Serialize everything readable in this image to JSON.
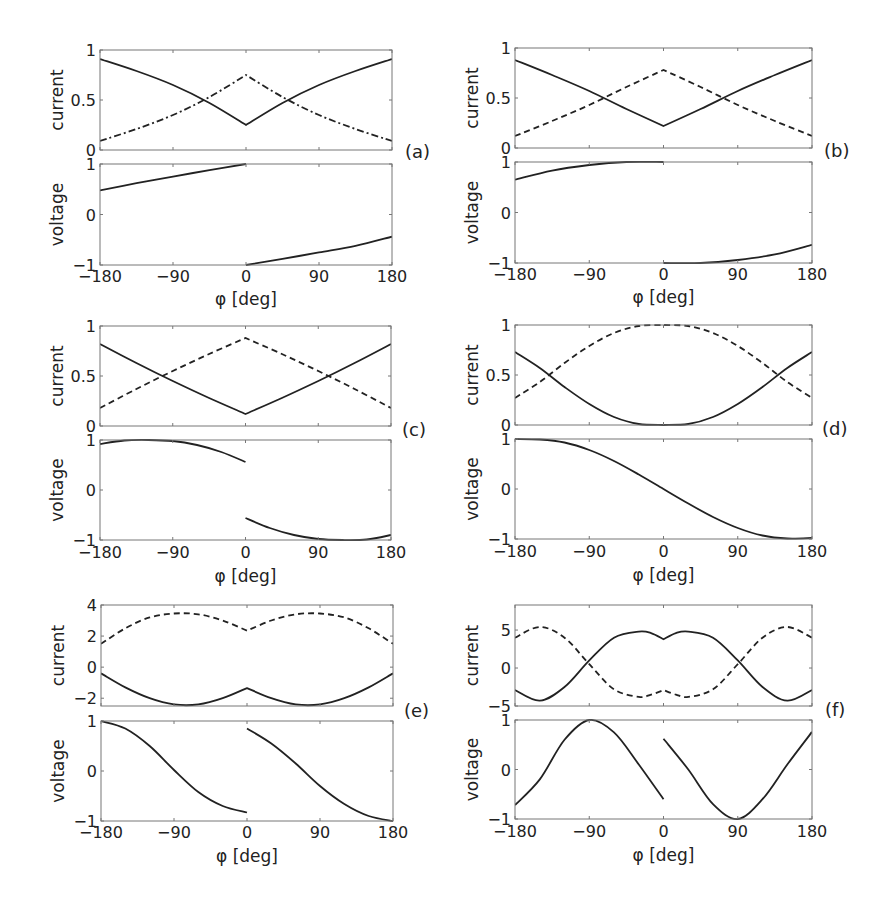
{
  "figure": {
    "x_tick_labels": [
      "−180",
      "−90",
      "0",
      "90",
      "180"
    ],
    "x_ticks": [
      -180,
      -90,
      0,
      90,
      180
    ],
    "xlabel": "φ [deg]",
    "current_label": "current",
    "voltage_label": "voltage"
  },
  "chart_data": [
    {
      "panel": "(a)",
      "type": "line",
      "xlabel": "φ [deg]",
      "xlim": [
        -180,
        180
      ],
      "subplots": [
        {
          "ylabel": "current",
          "ylim": [
            0,
            1
          ],
          "yticks": [
            0,
            0.5,
            1
          ],
          "ytick_labels": [
            "0",
            "0.5",
            "1"
          ],
          "series": [
            {
              "name": "solid",
              "style": "solid",
              "x": [
                -180,
                -135,
                -90,
                -45,
                0,
                45,
                90,
                135,
                180
              ],
              "y": [
                0.91,
                0.79,
                0.65,
                0.47,
                0.25,
                0.47,
                0.65,
                0.79,
                0.91
              ]
            },
            {
              "name": "dash-dot",
              "style": "dashdot",
              "x": [
                -180,
                -135,
                -90,
                -45,
                0,
                45,
                90,
                135,
                180
              ],
              "y": [
                0.09,
                0.21,
                0.35,
                0.53,
                0.75,
                0.53,
                0.35,
                0.21,
                0.09
              ]
            }
          ]
        },
        {
          "ylabel": "voltage",
          "ylim": [
            -1,
            1
          ],
          "yticks": [
            -1,
            0,
            1
          ],
          "ytick_labels": [
            "−1",
            "0",
            "1"
          ],
          "series": [
            {
              "name": "solid-left",
              "style": "solid",
              "x": [
                -180,
                -135,
                -90,
                -45,
                0
              ],
              "y": [
                0.48,
                0.62,
                0.75,
                0.88,
                1.0
              ]
            },
            {
              "name": "solid-right",
              "style": "solid",
              "x": [
                0,
                45,
                90,
                135,
                180
              ],
              "y": [
                -1.0,
                -0.88,
                -0.75,
                -0.62,
                -0.44
              ]
            }
          ]
        }
      ]
    },
    {
      "panel": "(b)",
      "type": "line",
      "xlabel": "φ [deg]",
      "xlim": [
        -180,
        180
      ],
      "subplots": [
        {
          "ylabel": "current",
          "ylim": [
            0,
            1
          ],
          "yticks": [
            0,
            0.5,
            1
          ],
          "ytick_labels": [
            "0",
            "0.5",
            "1"
          ],
          "series": [
            {
              "name": "solid",
              "style": "solid",
              "x": [
                -180,
                -135,
                -90,
                -45,
                0,
                45,
                90,
                135,
                180
              ],
              "y": [
                0.88,
                0.73,
                0.57,
                0.39,
                0.22,
                0.39,
                0.57,
                0.73,
                0.88
              ]
            },
            {
              "name": "dashed",
              "style": "dashed",
              "x": [
                -180,
                -135,
                -90,
                -45,
                0,
                45,
                90,
                135,
                180
              ],
              "y": [
                0.12,
                0.27,
                0.43,
                0.61,
                0.78,
                0.61,
                0.43,
                0.27,
                0.12
              ]
            }
          ]
        },
        {
          "ylabel": "voltage",
          "ylim": [
            -1,
            1
          ],
          "yticks": [
            -1,
            0,
            1
          ],
          "ytick_labels": [
            "−1",
            "0",
            "1"
          ],
          "series": [
            {
              "name": "solid-left",
              "style": "solid",
              "x": [
                -180,
                -135,
                -90,
                -45,
                0
              ],
              "y": [
                0.65,
                0.83,
                0.94,
                1.0,
                1.0
              ]
            },
            {
              "name": "solid-right",
              "style": "solid",
              "x": [
                0,
                45,
                90,
                135,
                180
              ],
              "y": [
                -1.0,
                -1.0,
                -0.94,
                -0.83,
                -0.64
              ]
            }
          ]
        }
      ]
    },
    {
      "panel": "(c)",
      "type": "line",
      "xlabel": "φ [deg]",
      "xlim": [
        -180,
        180
      ],
      "subplots": [
        {
          "ylabel": "current",
          "ylim": [
            0,
            1
          ],
          "yticks": [
            0,
            0.5,
            1
          ],
          "ytick_labels": [
            "0",
            "0.5",
            "1"
          ],
          "series": [
            {
              "name": "solid",
              "style": "solid",
              "x": [
                -180,
                -135,
                -90,
                -45,
                0,
                45,
                90,
                135,
                180
              ],
              "y": [
                0.82,
                0.63,
                0.45,
                0.28,
                0.12,
                0.28,
                0.45,
                0.63,
                0.82
              ]
            },
            {
              "name": "dashed",
              "style": "dashed",
              "x": [
                -180,
                -135,
                -90,
                -45,
                0,
                45,
                90,
                135,
                180
              ],
              "y": [
                0.18,
                0.37,
                0.55,
                0.72,
                0.88,
                0.72,
                0.55,
                0.37,
                0.18
              ]
            }
          ]
        },
        {
          "ylabel": "voltage",
          "ylim": [
            -1,
            1
          ],
          "yticks": [
            -1,
            0,
            1
          ],
          "ytick_labels": [
            "−1",
            "0",
            "1"
          ],
          "series": [
            {
              "name": "solid-left",
              "style": "solid",
              "x": [
                -180,
                -150,
                -120,
                -90,
                -60,
                -30,
                0
              ],
              "y": [
                0.92,
                0.99,
                1.0,
                0.98,
                0.9,
                0.76,
                0.56
              ]
            },
            {
              "name": "solid-right",
              "style": "solid",
              "x": [
                0,
                30,
                60,
                90,
                120,
                150,
                180
              ],
              "y": [
                -0.56,
                -0.76,
                -0.9,
                -0.98,
                -1.0,
                -0.99,
                -0.9
              ]
            }
          ]
        }
      ]
    },
    {
      "panel": "(d)",
      "type": "line",
      "xlabel": "φ [deg]",
      "xlim": [
        -180,
        180
      ],
      "subplots": [
        {
          "ylabel": "current",
          "ylim": [
            0,
            1
          ],
          "yticks": [
            0,
            0.5,
            1
          ],
          "ytick_labels": [
            "0",
            "0.5",
            "1"
          ],
          "series": [
            {
              "name": "solid",
              "style": "solid",
              "x": [
                -180,
                -150,
                -120,
                -90,
                -60,
                -30,
                0,
                30,
                60,
                90,
                120,
                150,
                180
              ],
              "y": [
                0.73,
                0.57,
                0.38,
                0.21,
                0.08,
                0.01,
                0.0,
                0.01,
                0.08,
                0.21,
                0.38,
                0.57,
                0.73
              ]
            },
            {
              "name": "dashed",
              "style": "dashed",
              "x": [
                -180,
                -150,
                -120,
                -90,
                -60,
                -30,
                0,
                30,
                60,
                90,
                120,
                150,
                180
              ],
              "y": [
                0.27,
                0.43,
                0.62,
                0.79,
                0.92,
                0.99,
                1.0,
                0.99,
                0.92,
                0.79,
                0.62,
                0.43,
                0.27
              ]
            }
          ]
        },
        {
          "ylabel": "voltage",
          "ylim": [
            -1,
            1
          ],
          "yticks": [
            -1,
            0,
            1
          ],
          "ytick_labels": [
            "−1",
            "0",
            "1"
          ],
          "series": [
            {
              "name": "solid",
              "style": "solid",
              "x": [
                -180,
                -150,
                -120,
                -90,
                -60,
                -30,
                0,
                30,
                60,
                90,
                120,
                150,
                180
              ],
              "y": [
                1.0,
                0.99,
                0.93,
                0.78,
                0.56,
                0.29,
                0.0,
                -0.29,
                -0.56,
                -0.78,
                -0.93,
                -0.99,
                -0.98
              ]
            }
          ]
        }
      ]
    },
    {
      "panel": "(e)",
      "type": "line",
      "xlabel": "φ [deg]",
      "xlim": [
        -180,
        180
      ],
      "subplots": [
        {
          "ylabel": "current",
          "ylim": [
            -2.5,
            4
          ],
          "yticks": [
            -2,
            0,
            2,
            4
          ],
          "ytick_labels": [
            "−2",
            "0",
            "2",
            "4"
          ],
          "series": [
            {
              "name": "solid",
              "style": "solid",
              "x": [
                -180,
                -150,
                -120,
                -90,
                -60,
                -30,
                0,
                30,
                60,
                90,
                120,
                150,
                180
              ],
              "y": [
                -0.4,
                -1.3,
                -2.0,
                -2.4,
                -2.4,
                -2.0,
                -1.35,
                -2.0,
                -2.4,
                -2.4,
                -2.0,
                -1.3,
                -0.4
              ]
            },
            {
              "name": "dashed",
              "style": "dashed",
              "x": [
                -180,
                -150,
                -120,
                -90,
                -60,
                -30,
                0,
                30,
                60,
                90,
                120,
                150,
                180
              ],
              "y": [
                1.5,
                2.5,
                3.2,
                3.45,
                3.4,
                3.0,
                2.35,
                3.0,
                3.4,
                3.45,
                3.2,
                2.5,
                1.5
              ]
            }
          ]
        },
        {
          "ylabel": "voltage",
          "ylim": [
            -1,
            1
          ],
          "yticks": [
            -1,
            0,
            1
          ],
          "ytick_labels": [
            "−1",
            "0",
            "1"
          ],
          "series": [
            {
              "name": "solid-left",
              "style": "solid",
              "x": [
                -180,
                -150,
                -120,
                -90,
                -60,
                -30,
                0
              ],
              "y": [
                1.0,
                0.85,
                0.5,
                0.02,
                -0.42,
                -0.7,
                -0.83
              ]
            },
            {
              "name": "solid-right",
              "style": "solid",
              "x": [
                0,
                30,
                60,
                90,
                120,
                150,
                180
              ],
              "y": [
                0.85,
                0.55,
                0.15,
                -0.3,
                -0.66,
                -0.9,
                -1.0
              ]
            }
          ]
        }
      ]
    },
    {
      "panel": "(f)",
      "type": "line",
      "xlabel": "φ [deg]",
      "xlim": [
        -180,
        180
      ],
      "subplots": [
        {
          "ylabel": "current",
          "ylim": [
            -5,
            8.3
          ],
          "yticks": [
            -5,
            0,
            5
          ],
          "ytick_labels": [
            "−5",
            "0",
            "5"
          ],
          "series": [
            {
              "name": "solid",
              "style": "solid",
              "x": [
                -180,
                -150,
                -120,
                -90,
                -60,
                -30,
                -15,
                0,
                15,
                30,
                60,
                90,
                120,
                150,
                180
              ],
              "y": [
                -2.9,
                -4.3,
                -2.5,
                1.0,
                4.0,
                4.8,
                4.6,
                3.8,
                4.6,
                4.8,
                4.0,
                1.0,
                -2.5,
                -4.3,
                -2.9
              ]
            },
            {
              "name": "dashed",
              "style": "dashed",
              "x": [
                -180,
                -150,
                -120,
                -90,
                -60,
                -30,
                -15,
                0,
                15,
                30,
                60,
                90,
                120,
                150,
                180
              ],
              "y": [
                4.0,
                5.4,
                4.0,
                0.5,
                -2.8,
                -3.8,
                -3.5,
                -2.9,
                -3.5,
                -3.8,
                -2.8,
                0.5,
                4.0,
                5.4,
                4.0
              ]
            }
          ]
        },
        {
          "ylabel": "voltage",
          "ylim": [
            -1,
            1
          ],
          "yticks": [
            -1,
            0,
            1
          ],
          "ytick_labels": [
            "−1",
            "0",
            "1"
          ],
          "series": [
            {
              "name": "solid-left",
              "style": "solid",
              "x": [
                -180,
                -150,
                -120,
                -90,
                -60,
                -30,
                0
              ],
              "y": [
                -0.72,
                -0.2,
                0.6,
                1.0,
                0.75,
                0.1,
                -0.6
              ]
            },
            {
              "name": "solid-right",
              "style": "solid",
              "x": [
                0,
                30,
                60,
                90,
                120,
                150,
                180
              ],
              "y": [
                0.62,
                0.0,
                -0.7,
                -1.0,
                -0.6,
                0.1,
                0.76
              ]
            }
          ]
        }
      ]
    }
  ]
}
